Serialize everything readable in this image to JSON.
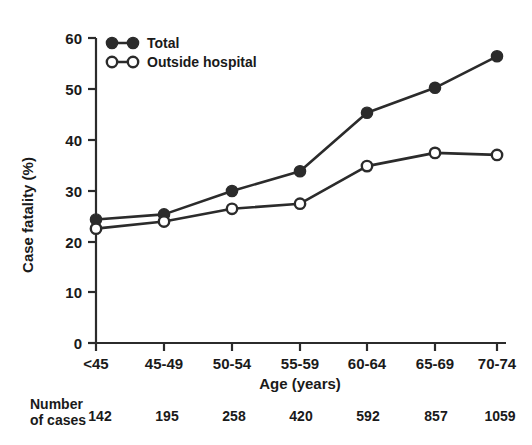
{
  "chart_data": {
    "type": "line",
    "title": "",
    "xlabel": "Age (years)",
    "ylabel": "Case fatality (%)",
    "categories": [
      "<45",
      "45-49",
      "50-54",
      "55-59",
      "60-64",
      "65-69",
      "70-74"
    ],
    "ylim": [
      0,
      60
    ],
    "yticks": [
      0,
      10,
      20,
      30,
      40,
      50,
      60
    ],
    "ytick_labels": [
      "0",
      "10",
      "20",
      "30",
      "40",
      "50",
      "60"
    ],
    "grid": false,
    "legend_position": "top-left",
    "series": [
      {
        "name": "Total",
        "marker": "filled-circle",
        "values": [
          24.3,
          25.3,
          29.9,
          33.8,
          45.3,
          50.2,
          56.4
        ]
      },
      {
        "name": "Outside hospital",
        "marker": "open-circle",
        "values": [
          22.5,
          23.9,
          26.4,
          27.4,
          34.8,
          37.4,
          37.0
        ]
      }
    ],
    "annotations": {
      "number_of_cases_label_line1": "Number",
      "number_of_cases_label_line2": "of cases",
      "number_of_cases": [
        "142",
        "195",
        "258",
        "420",
        "592",
        "857",
        "1059"
      ]
    },
    "colors": {
      "ink": "#2b2b2b",
      "background": "#ffffff",
      "marker_fill_total": "#2b2b2b",
      "marker_fill_outside": "#ffffff"
    }
  }
}
